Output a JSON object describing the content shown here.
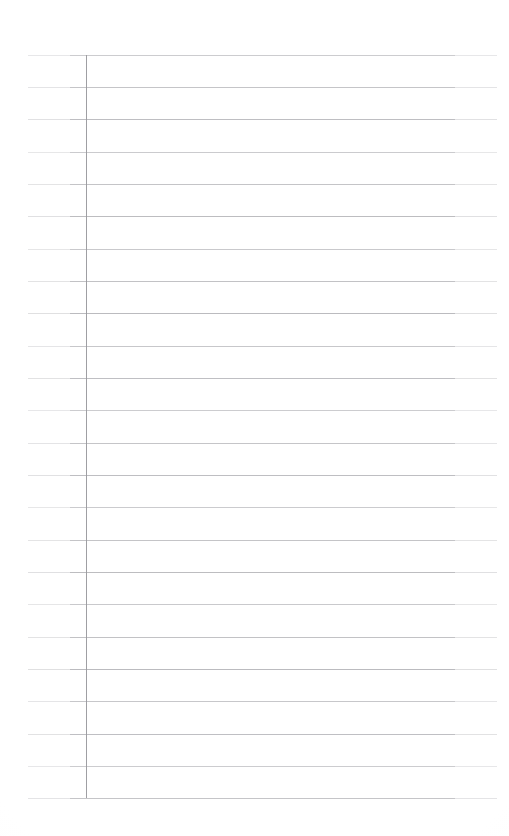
{
  "document": {
    "kind": "scanned-ruled-paper",
    "title": "Blank ruled notebook page",
    "page_width": 509,
    "page_height": 836,
    "background_color": "#ffffff",
    "content_text": "",
    "has_handwriting": false,
    "has_printed_text": false
  },
  "ruling": {
    "rule_color": "#b9b9bd",
    "rule_thickness": 1,
    "rule_count": 24,
    "rule_spacing": 32.3,
    "first_rule_y": 55,
    "last_rule_y": 798,
    "rule_left_x": 28,
    "rule_right_x": 497,
    "rule_y_positions": [
      55,
      87,
      119,
      152,
      184,
      216,
      249,
      281,
      313,
      346,
      378,
      410,
      443,
      475,
      507,
      540,
      572,
      604,
      637,
      669,
      701,
      734,
      766,
      798
    ]
  },
  "margin": {
    "name": "vertical-margin-rule",
    "color": "#9a9a9e",
    "thickness": 1,
    "x": 86,
    "top_y": 55,
    "bottom_y": 798
  },
  "edges": {
    "top_blank_margin": 55,
    "bottom_blank_margin": 38,
    "left_blank_margin": 28,
    "right_blank_margin": 12
  }
}
